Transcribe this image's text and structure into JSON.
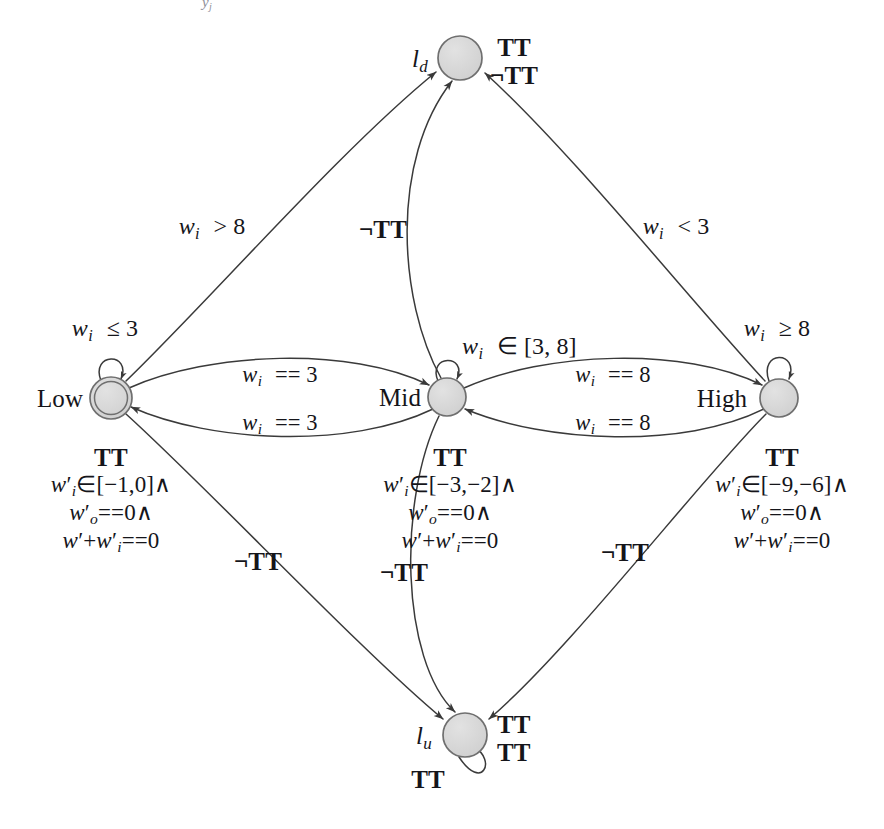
{
  "diagram": {
    "type": "hybrid-automaton-state-diagram",
    "title_fragment_top": "",
    "colors": {
      "node_fill": "#d4d4d4",
      "node_stroke": "#6f6f6f",
      "edge_stroke": "#3a3a3a",
      "text": "#15151a",
      "background": "#ffffff"
    },
    "nodes": [
      {
        "id": "ld",
        "label": "l",
        "label_sub": "d",
        "label_position": "left",
        "shape": "circle",
        "double": false,
        "cx": 460,
        "cy": 58,
        "r": 22,
        "annotation_lines": [
          "TT",
          "¬TT"
        ],
        "annotation_position": "right"
      },
      {
        "id": "low",
        "label": "Low",
        "label_sub": "",
        "label_position": "left",
        "shape": "circle",
        "double": true,
        "cx": 111,
        "cy": 398,
        "r": 20,
        "self_loop_guard_mi": "w",
        "self_loop_guard_sub": "i",
        "self_loop_guard_rest": "≤ 3",
        "invariant_lines": [
          "TT",
          "w'i∈[−1,0]∧",
          "w'o==0∧",
          "w'+w'i==0"
        ],
        "annotation_position": "below"
      },
      {
        "id": "mid",
        "label": "Mid",
        "label_sub": "",
        "label_position": "left",
        "shape": "circle",
        "double": false,
        "cx": 447,
        "cy": 397,
        "r": 19,
        "self_loop_guard_mi": "w",
        "self_loop_guard_sub": "i",
        "self_loop_guard_rest": "∈ [3, 8]",
        "invariant_lines": [
          "TT",
          "w'i∈[−3,−2]∧",
          "w'o==0∧",
          "w'+w'i==0"
        ],
        "annotation_position": "below"
      },
      {
        "id": "high",
        "label": "High",
        "label_sub": "",
        "label_position": "left",
        "shape": "circle",
        "double": false,
        "cx": 779,
        "cy": 398,
        "r": 19,
        "self_loop_guard_mi": "w",
        "self_loop_guard_sub": "i",
        "self_loop_guard_rest": "≥ 8",
        "invariant_lines": [
          "TT",
          "w'i∈[−9,−6]∧",
          "w'o==0∧",
          "w'+w'i==0"
        ],
        "annotation_position": "below"
      },
      {
        "id": "lu",
        "label": "l",
        "label_sub": "u",
        "label_position": "left",
        "shape": "circle",
        "double": false,
        "cx": 465,
        "cy": 735,
        "r": 22,
        "annotation_lines": [
          "TT",
          "TT"
        ],
        "annotation_position": "right",
        "self_loop_label": "TT",
        "self_loop_position": "below"
      }
    ],
    "edge_labels": [
      {
        "id": "low-to-ld",
        "text_mi": "w",
        "text_sub": "i",
        "text_rest": "> 8",
        "x": 212,
        "y": 228
      },
      {
        "id": "mid-to-ld",
        "text_plain": "¬TT",
        "x": 383,
        "y": 230
      },
      {
        "id": "high-to-ld",
        "text_mi": "w",
        "text_sub": "i",
        "text_rest": "< 3",
        "x": 676,
        "y": 228
      },
      {
        "id": "low-to-mid",
        "text_mi": "w",
        "text_sub": "i",
        "text_rest": "== 3",
        "x": 280,
        "y": 376
      },
      {
        "id": "mid-to-low",
        "text_mi": "w",
        "text_sub": "i",
        "text_rest": "== 3",
        "x": 280,
        "y": 424
      },
      {
        "id": "mid-to-high",
        "text_mi": "w",
        "text_sub": "i",
        "text_rest": "== 8",
        "x": 613,
        "y": 376
      },
      {
        "id": "high-to-mid",
        "text_mi": "w",
        "text_sub": "i",
        "text_rest": "== 8",
        "x": 613,
        "y": 424
      },
      {
        "id": "low-to-lu",
        "text_plain": "¬TT",
        "x": 258,
        "y": 562
      },
      {
        "id": "mid-to-lu",
        "text_plain": "¬TT",
        "x": 404,
        "y": 573
      },
      {
        "id": "high-to-lu",
        "text_plain": "¬TT",
        "x": 625,
        "y": 553
      }
    ],
    "self_loop_guards": [
      {
        "id": "low-loop",
        "x": 105,
        "y": 330
      },
      {
        "id": "mid-loop",
        "x": 506,
        "y": 345
      },
      {
        "id": "high-loop",
        "x": 777,
        "y": 330
      }
    ],
    "transitions": [
      {
        "from": "Low",
        "to": "l_d",
        "guard": "w_i > 8"
      },
      {
        "from": "Mid",
        "to": "l_d",
        "guard": "¬TT"
      },
      {
        "from": "High",
        "to": "l_d",
        "guard": "w_i < 3"
      },
      {
        "from": "Low",
        "to": "Mid",
        "guard": "w_i == 3"
      },
      {
        "from": "Mid",
        "to": "Low",
        "guard": "w_i == 3"
      },
      {
        "from": "Mid",
        "to": "High",
        "guard": "w_i == 8"
      },
      {
        "from": "High",
        "to": "Mid",
        "guard": "w_i == 8"
      },
      {
        "from": "Low",
        "to": "l_u",
        "guard": "¬TT"
      },
      {
        "from": "Mid",
        "to": "l_u",
        "guard": "¬TT"
      },
      {
        "from": "High",
        "to": "l_u",
        "guard": "¬TT"
      },
      {
        "from": "Low",
        "to": "Low",
        "guard": "w_i ≤ 3"
      },
      {
        "from": "Mid",
        "to": "Mid",
        "guard": "w_i ∈ [3, 8]"
      },
      {
        "from": "High",
        "to": "High",
        "guard": "w_i ≥ 8"
      },
      {
        "from": "l_u",
        "to": "l_u",
        "guard": "TT"
      }
    ]
  }
}
